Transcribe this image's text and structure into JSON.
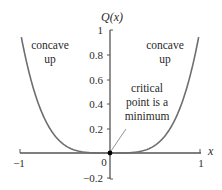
{
  "chart_data": {
    "type": "line",
    "title": "",
    "function": "Q(x) = x^4",
    "xlabel": "x",
    "ylabel": "Q(x)",
    "xlim": [
      -1,
      1
    ],
    "ylim": [
      -0.2,
      1
    ],
    "x_ticks": [
      -1,
      0,
      1
    ],
    "x_tick_labels": [
      "−1",
      "0",
      "1"
    ],
    "y_ticks": [
      1,
      0.8,
      0.6,
      0.4,
      0.2,
      0,
      -0.2
    ],
    "y_tick_labels": [
      "1",
      "0.8",
      "0.6",
      "0.4",
      "0.2",
      "0",
      "−0.2"
    ],
    "grid": false,
    "series": [
      {
        "name": "Q(x)",
        "x": [
          -0.99,
          -0.9,
          -0.8,
          -0.7,
          -0.6,
          -0.5,
          -0.4,
          -0.3,
          -0.2,
          -0.1,
          0,
          0.1,
          0.2,
          0.3,
          0.4,
          0.5,
          0.6,
          0.7,
          0.8,
          0.9,
          0.99
        ],
        "y": [
          0.96,
          0.656,
          0.41,
          0.24,
          0.13,
          0.0625,
          0.026,
          0.008,
          0.0016,
          0.0001,
          0,
          0.0001,
          0.0016,
          0.008,
          0.026,
          0.0625,
          0.13,
          0.24,
          0.41,
          0.656,
          0.96
        ],
        "color": "#6e6e6e"
      }
    ],
    "points": [
      {
        "x": 0,
        "y": 0,
        "label": "critical point"
      }
    ],
    "annotations": [
      {
        "text_lines": [
          "concave",
          "up"
        ],
        "position": "upper-left"
      },
      {
        "text_lines": [
          "concave",
          "up"
        ],
        "position": "upper-right"
      },
      {
        "text_lines": [
          "critical",
          "point is a",
          "minimum"
        ],
        "points_to": [
          0,
          0
        ]
      }
    ]
  },
  "labels": {
    "ylabel": "Q(x)",
    "xlabel": "x",
    "left_annotation_line1": "concave",
    "left_annotation_line2": "up",
    "right_annotation_line1": "concave",
    "right_annotation_line2": "up",
    "critical_line1": "critical",
    "critical_line2": "point is a",
    "critical_line3": "minimum",
    "xtick_neg1": "−1",
    "xtick_0": "0",
    "xtick_1": "1",
    "ytick_1": "1",
    "ytick_08": "0.8",
    "ytick_06": "0.6",
    "ytick_04": "0.4",
    "ytick_02": "0.2",
    "ytick_neg02": "−0.2"
  },
  "colors": {
    "curve": "#6e6e6e",
    "axis": "#555555",
    "text": "#2a2a2a",
    "point": "#000000"
  }
}
